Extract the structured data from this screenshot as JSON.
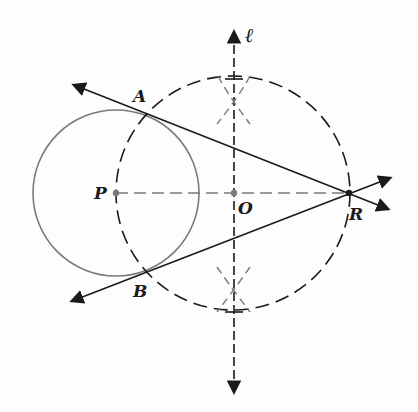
{
  "diagram": {
    "title": "",
    "colors": {
      "ink": "#1a1a1a",
      "grey_line": "#7a7a7a",
      "background": "#fdfdfd"
    },
    "labels": {
      "A": "A",
      "B": "B",
      "P": "P",
      "O": "O",
      "R": "R",
      "ell": "ℓ"
    },
    "points": {
      "P": {
        "x": 116,
        "y": 193
      },
      "O": {
        "x": 233,
        "y": 193
      },
      "R": {
        "x": 349,
        "y": 193
      },
      "A": {
        "x": 146,
        "y": 113
      },
      "B": {
        "x": 146,
        "y": 275
      }
    },
    "circles": [
      {
        "name": "circle-P",
        "center": "P",
        "radius": 83,
        "style": "solid-grey"
      },
      {
        "name": "circle-O",
        "center": "O",
        "radius": 117,
        "style": "dashed"
      }
    ],
    "lines": [
      {
        "name": "tangent-RA",
        "through": [
          "R",
          "A"
        ],
        "style": "solid",
        "arrows": "both"
      },
      {
        "name": "tangent-RB",
        "through": [
          "R",
          "B"
        ],
        "style": "solid",
        "arrows": "both"
      },
      {
        "name": "segment-PR",
        "through": [
          "P",
          "R"
        ],
        "style": "dashed-grey",
        "arrows": "none"
      },
      {
        "name": "line-ell",
        "label": "ℓ",
        "style": "dashed",
        "arrows": "both",
        "note": "perpendicular bisector of PR"
      }
    ],
    "construction_arcs": [
      "upper arc pair above O",
      "lower arc pair below O"
    ]
  }
}
